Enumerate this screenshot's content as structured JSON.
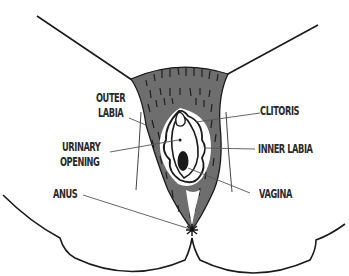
{
  "diagram": {
    "type": "anatomical illustration",
    "colors": {
      "outline": "#1a1a1a",
      "fill": "#6e6e6e",
      "hair_marks": "#222222",
      "leader_line": "#555555",
      "label_text": "#2a2a2a",
      "background": "#ffffff"
    },
    "labels": {
      "outer_labia_line1": "OUTER",
      "outer_labia_line2": "LABIA",
      "clitoris": "CLITORIS",
      "urinary_line1": "URINARY",
      "urinary_line2": "OPENING",
      "inner_labia": "INNER LABIA",
      "anus": "ANUS",
      "vagina": "VAGINA"
    }
  }
}
